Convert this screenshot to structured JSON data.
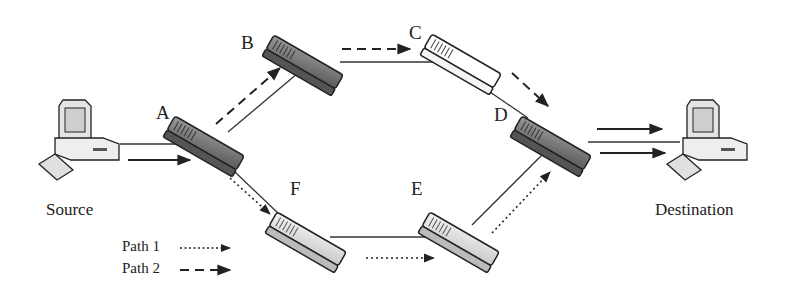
{
  "nodes": {
    "A": {
      "label": "A"
    },
    "B": {
      "label": "B"
    },
    "C": {
      "label": "C"
    },
    "D": {
      "label": "D"
    },
    "E": {
      "label": "E"
    },
    "F": {
      "label": "F"
    }
  },
  "endpoints": {
    "source": {
      "label": "Source",
      "icon": "desktop-computer-icon"
    },
    "destination": {
      "label": "Destination",
      "icon": "desktop-computer-icon"
    }
  },
  "links": [
    [
      "Source",
      "A"
    ],
    [
      "A",
      "B"
    ],
    [
      "B",
      "C"
    ],
    [
      "C",
      "D"
    ],
    [
      "D",
      "Destination"
    ],
    [
      "A",
      "F"
    ],
    [
      "F",
      "E"
    ],
    [
      "E",
      "D"
    ]
  ],
  "paths": [
    {
      "name": "Path 1",
      "style": "dotted",
      "route": [
        "Source",
        "A",
        "F",
        "E",
        "D",
        "Destination"
      ]
    },
    {
      "name": "Path 2",
      "style": "dashed",
      "route": [
        "Source",
        "A",
        "B",
        "C",
        "D",
        "Destination"
      ]
    }
  ],
  "legend": {
    "path1_label": "Path 1",
    "path2_label": "Path 2"
  },
  "colors": {
    "line": "#333333",
    "switch_dark": "#6e6e6e",
    "switch_light": "#e6e6e6",
    "switch_white": "#ffffff"
  }
}
